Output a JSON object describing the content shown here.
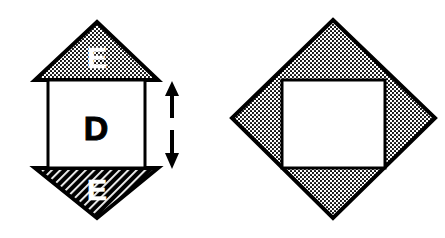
{
  "canvas": {
    "width": 445,
    "height": 238,
    "background": "#ffffff",
    "ink": "#000000"
  },
  "figure_left": {
    "name": "stacked-square-with-triangles",
    "square": {
      "label": "D",
      "label_color": "#000000",
      "fill": "#ffffff",
      "stroke": "#000000",
      "x": 48,
      "y": 80,
      "width": 97,
      "height": 88,
      "label_x": 96,
      "label_y": 131
    },
    "triangle_top": {
      "label": "E",
      "label_color": "#ffffff",
      "fill_pattern": "dots",
      "stroke": "#000000",
      "points": "97,22 158,80 35,80",
      "label_x": 97,
      "label_y": 60
    },
    "triangle_bottom": {
      "label": "E",
      "label_color": "#ffffff",
      "fill_pattern": "diagonal-hatch",
      "stroke": "#000000",
      "points": "35,168 158,168 97,218",
      "label_x": 97,
      "label_y": 192
    },
    "dimension_arrow": {
      "name": "height-dimension-arrow",
      "x": 172,
      "y_top": 82,
      "y_bottom": 168,
      "stroke": "#000000"
    }
  },
  "figure_right": {
    "name": "rotated-diamond-with-inner-square",
    "diamond": {
      "fill_pattern": "dots",
      "stroke": "#000000",
      "points": "333,20 435,118 333,218 232,118"
    },
    "inner_square": {
      "fill": "#ffffff",
      "stroke": "#000000",
      "x": 282,
      "y": 80,
      "width": 103,
      "height": 88
    }
  },
  "patterns": {
    "dots": {
      "name": "stipple-dot-fill",
      "background": "#ffffff",
      "dot_color": "#000000",
      "spacing": 4,
      "radius": 1.05
    },
    "diagonal_hatch": {
      "name": "diagonal-hatch-fill",
      "background": "#000000",
      "line_color": "#ffffff",
      "spacing": 6,
      "line_width": 1.8
    }
  }
}
